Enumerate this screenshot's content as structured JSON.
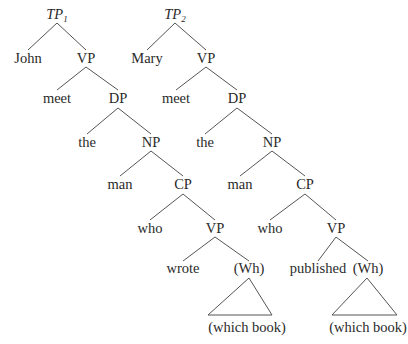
{
  "diagram": {
    "type": "syntax-tree-comparison",
    "trees": [
      {
        "id": "tree-1",
        "root": {
          "label": "TP",
          "subscript": "1",
          "x": 57,
          "y": 19
        },
        "nodes": [
          {
            "id": "john",
            "label": "John",
            "x": 28,
            "y": 63
          },
          {
            "id": "vp1",
            "label": "VP",
            "x": 86,
            "y": 63
          },
          {
            "id": "meet",
            "label": "meet",
            "x": 57,
            "y": 103
          },
          {
            "id": "dp",
            "label": "DP",
            "x": 118,
            "y": 103
          },
          {
            "id": "the",
            "label": "the",
            "x": 87,
            "y": 147
          },
          {
            "id": "np",
            "label": "NP",
            "x": 151,
            "y": 147
          },
          {
            "id": "man",
            "label": "man",
            "x": 120,
            "y": 189
          },
          {
            "id": "cp",
            "label": "CP",
            "x": 183,
            "y": 189
          },
          {
            "id": "who",
            "label": "who",
            "x": 150,
            "y": 233
          },
          {
            "id": "vp2",
            "label": "VP",
            "x": 215,
            "y": 233
          },
          {
            "id": "verb",
            "label": "wrote",
            "x": 183,
            "y": 273
          },
          {
            "id": "wh",
            "label": "(Wh)",
            "x": 249,
            "y": 273
          },
          {
            "id": "phrase",
            "label": "(which book)",
            "x": 247,
            "y": 332
          }
        ],
        "edges": [
          [
            57,
            23,
            28,
            50
          ],
          [
            57,
            23,
            86,
            50
          ],
          [
            86,
            67,
            57,
            90
          ],
          [
            86,
            67,
            118,
            90
          ],
          [
            118,
            108,
            87,
            134
          ],
          [
            118,
            108,
            151,
            134
          ],
          [
            151,
            151,
            120,
            176
          ],
          [
            151,
            151,
            183,
            176
          ],
          [
            183,
            194,
            150,
            220
          ],
          [
            183,
            194,
            215,
            220
          ],
          [
            215,
            237,
            183,
            261
          ],
          [
            215,
            237,
            249,
            261
          ]
        ],
        "triangle": {
          "apex": [
            249,
            278
          ],
          "left": [
            208,
            315
          ],
          "right": [
            272,
            315
          ]
        }
      },
      {
        "id": "tree-2",
        "root": {
          "label": "TP",
          "subscript": "2",
          "x": 175,
          "y": 19
        },
        "nodes": [
          {
            "id": "mary",
            "label": "Mary",
            "x": 147,
            "y": 63
          },
          {
            "id": "vp1",
            "label": "VP",
            "x": 206,
            "y": 63
          },
          {
            "id": "meet",
            "label": "meet",
            "x": 176,
            "y": 103
          },
          {
            "id": "dp",
            "label": "DP",
            "x": 237,
            "y": 103
          },
          {
            "id": "the",
            "label": "the",
            "x": 205,
            "y": 147
          },
          {
            "id": "np",
            "label": "NP",
            "x": 272,
            "y": 147
          },
          {
            "id": "man",
            "label": "man",
            "x": 240,
            "y": 189
          },
          {
            "id": "cp",
            "label": "CP",
            "x": 305,
            "y": 189
          },
          {
            "id": "who",
            "label": "who",
            "x": 270,
            "y": 233
          },
          {
            "id": "vp2",
            "label": "VP",
            "x": 336,
            "y": 233
          },
          {
            "id": "verb",
            "label": "published",
            "x": 318,
            "y": 273
          },
          {
            "id": "wh",
            "label": "(Wh)",
            "x": 368,
            "y": 273
          },
          {
            "id": "phrase",
            "label": "(which book)",
            "x": 368,
            "y": 332
          }
        ],
        "edges": [
          [
            175,
            23,
            147,
            50
          ],
          [
            175,
            23,
            206,
            50
          ],
          [
            206,
            67,
            176,
            90
          ],
          [
            206,
            67,
            237,
            90
          ],
          [
            237,
            108,
            205,
            134
          ],
          [
            237,
            108,
            272,
            134
          ],
          [
            272,
            151,
            240,
            176
          ],
          [
            272,
            151,
            305,
            176
          ],
          [
            305,
            194,
            270,
            220
          ],
          [
            305,
            194,
            336,
            220
          ],
          [
            336,
            237,
            318,
            261
          ],
          [
            336,
            237,
            368,
            261
          ]
        ],
        "triangle": {
          "apex": [
            367,
            278
          ],
          "left": [
            332,
            315
          ],
          "right": [
            397,
            315
          ]
        }
      }
    ]
  }
}
